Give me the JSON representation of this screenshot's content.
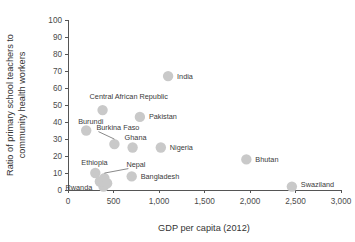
{
  "chart_data": {
    "type": "scatter",
    "title": "",
    "xlabel": "GDP per capita (2012)",
    "ylabel": "Ratio of primary school teachers to community health workers",
    "ylabel_line1": "Ratio of primary school teachers to",
    "ylabel_line2": "community health workers",
    "xlim": [
      0,
      3000
    ],
    "ylim": [
      0,
      100
    ],
    "xticks": [
      0,
      500,
      1000,
      1500,
      2000,
      2500,
      3000
    ],
    "xticklabels": [
      "0",
      "500",
      "1,000",
      "1,500",
      "2,000",
      "2,500",
      "3,000"
    ],
    "yticks": [
      0,
      10,
      20,
      30,
      40,
      50,
      60,
      70,
      80,
      90,
      100
    ],
    "yticklabels": [
      "0",
      "10",
      "20",
      "30",
      "40",
      "50",
      "60",
      "70",
      "80",
      "90",
      "100"
    ],
    "grid": false,
    "legend": null,
    "marker_color": "#c9c9c9",
    "axis_color": "#555555",
    "points": [
      {
        "label": "India",
        "x": 1100,
        "y": 67,
        "label_dx": 9,
        "label_dy": 2.5,
        "anchor": "start",
        "leader": false
      },
      {
        "label": "Central African Republic",
        "x": 380,
        "y": 47,
        "label_dx": -13,
        "label_dy": -11,
        "anchor": "start",
        "leader": false
      },
      {
        "label": "Pakistan",
        "x": 790,
        "y": 43,
        "label_dx": 9,
        "label_dy": 2.5,
        "anchor": "start",
        "leader": false
      },
      {
        "label": "Burundi",
        "x": 200,
        "y": 35,
        "label_dx": -8,
        "label_dy": -7,
        "anchor": "start",
        "leader": false
      },
      {
        "label": "Burkina Faso",
        "x": 510,
        "y": 27,
        "label_dx": -18,
        "label_dy": -14,
        "anchor": "start",
        "leader": true
      },
      {
        "label": "Ghana",
        "x": 710,
        "y": 25,
        "label_dx": -8,
        "label_dy": -7.5,
        "anchor": "start",
        "leader": false
      },
      {
        "label": "Nigeria",
        "x": 1020,
        "y": 25,
        "label_dx": 9,
        "label_dy": 2.5,
        "anchor": "start",
        "leader": false
      },
      {
        "label": "Bhutan",
        "x": 1960,
        "y": 18,
        "label_dx": 9,
        "label_dy": 2.5,
        "anchor": "start",
        "leader": false
      },
      {
        "label": "Ethiopia",
        "x": 300,
        "y": 10,
        "label_dx": -14,
        "label_dy": -8,
        "anchor": "start",
        "leader": false
      },
      {
        "label": "Nepal",
        "x": 400,
        "y": 7,
        "label_dx": 22,
        "label_dy": -11,
        "anchor": "start",
        "leader": true
      },
      {
        "label": "Bangladesh",
        "x": 700,
        "y": 8,
        "label_dx": 9,
        "label_dy": 3,
        "anchor": "start",
        "leader": false
      },
      {
        "label": "Rwanda",
        "x": 390,
        "y": 2,
        "label_dx": -38,
        "label_dy": 3,
        "anchor": "start",
        "leader": false
      },
      {
        "label": "Swaziland",
        "x": 2460,
        "y": 2,
        "label_dx": 9,
        "label_dy": 0,
        "anchor": "start",
        "leader": false
      },
      {
        "label": "",
        "x": 350,
        "y": 5,
        "label_dx": 0,
        "label_dy": 0,
        "leader": false
      },
      {
        "label": "",
        "x": 430,
        "y": 4,
        "label_dx": 0,
        "label_dy": 0,
        "leader": false
      }
    ]
  }
}
